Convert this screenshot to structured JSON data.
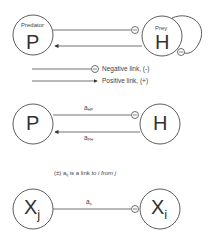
{
  "panel1": {
    "predator_label": "Predator",
    "predator_symbol": "P",
    "prey_label": "Prey",
    "prey_symbol": "H"
  },
  "legend": {
    "negative": "Negative link, (-)",
    "positive": "Positive link, (+)"
  },
  "panel2": {
    "left_symbol": "P",
    "right_symbol": "H",
    "top_link": {
      "base": "a",
      "sub": "HP"
    },
    "bottom_link": {
      "base": "a",
      "sub": "PH"
    }
  },
  "caption": {
    "prefix": "(±) a",
    "sub": "ij",
    "mid": " is a link ",
    "to": "to i",
    "space": " ",
    "from": "from j"
  },
  "panel3": {
    "left_base": "X",
    "left_sub": "j",
    "right_base": "X",
    "right_sub": "i",
    "link": {
      "base": "a",
      "sub": "ij"
    }
  },
  "colors": {
    "stroke": "#333333",
    "text": "#444444",
    "background": "#ffffff"
  }
}
